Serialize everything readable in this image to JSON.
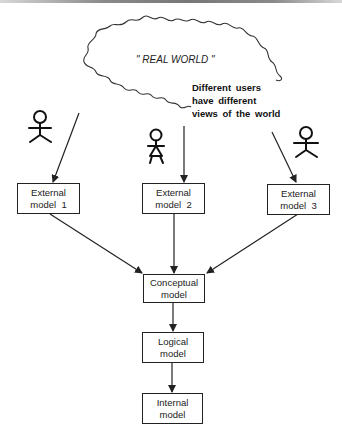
{
  "diagram": {
    "cloud": {
      "label": "\" REAL WORLD \""
    },
    "note": {
      "lines": [
        "Different users",
        "have different",
        "views of the world"
      ]
    },
    "users": [
      {
        "id": "user-1",
        "type": "stick-figure"
      },
      {
        "id": "user-2",
        "type": "stick-figure-dress"
      },
      {
        "id": "user-3",
        "type": "stick-figure"
      }
    ],
    "external_models": [
      {
        "line1": "External",
        "line2": "model  1"
      },
      {
        "line1": "External",
        "line2": "model  2"
      },
      {
        "line1": "External",
        "line2": "model  3"
      }
    ],
    "conceptual_model": {
      "line1": "Conceptual",
      "line2": "model"
    },
    "logical_model": {
      "line1": "Logical",
      "line2": "model"
    },
    "internal_model": {
      "line1": "Internal",
      "line2": "model"
    },
    "colors": {
      "stroke": "#222222",
      "background": "#ffffff"
    }
  }
}
